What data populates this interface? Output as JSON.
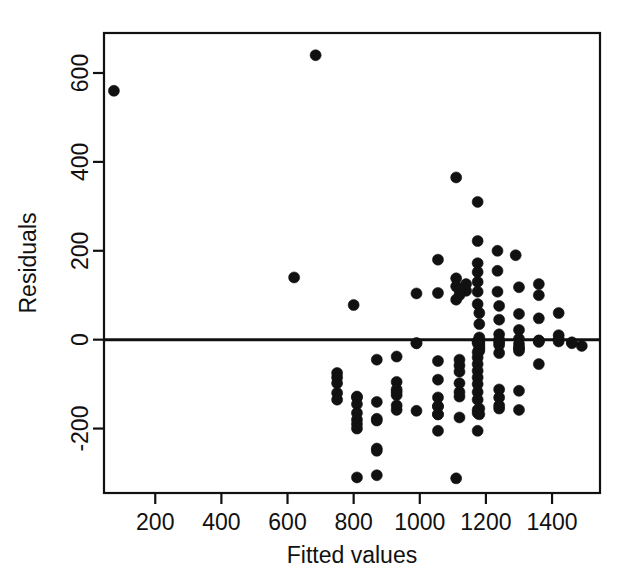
{
  "figure": {
    "kind": "residual-plot",
    "background_color": "#ffffff",
    "ink_color": "#111111"
  },
  "chart_data": {
    "type": "scatter",
    "title": "",
    "subtitle": "",
    "xlabel": "Fitted values",
    "ylabel": "Residuals",
    "xlim": [
      45,
      1545
    ],
    "ylim": [
      -345,
      690
    ],
    "xticks": [
      200,
      400,
      600,
      800,
      1000,
      1200,
      1400
    ],
    "xticklabels": [
      "200",
      "400",
      "600",
      "800",
      "1000",
      "1200",
      "1400"
    ],
    "yticks": [
      -200,
      0,
      200,
      400,
      600
    ],
    "yticklabels": [
      "-200",
      "0",
      "200",
      "400",
      "600"
    ],
    "grid": false,
    "legend": null,
    "legend_position": "none",
    "marker": {
      "shape": "circle",
      "filled": true,
      "color": "#111111",
      "size_px": 11
    },
    "reference_line": {
      "kind": "horizontal",
      "y": 0,
      "color": "#111111",
      "width_px": 3,
      "label": "zero residual line"
    },
    "n_points": 131,
    "x": [
      75,
      685,
      620,
      1055,
      1110,
      1175,
      1235,
      1175,
      1290,
      1175,
      1175,
      1235,
      1175,
      1110,
      1110,
      1175,
      1140,
      1140,
      1300,
      1360,
      1235,
      1360,
      1110,
      1175,
      1240,
      1300,
      1420,
      1360,
      1240,
      1300,
      1420,
      800,
      990,
      1180,
      1180,
      1240,
      1300,
      1360,
      1420,
      1460,
      1490,
      1180,
      1180,
      1180,
      1180,
      1180,
      1180,
      1180,
      1120,
      1055,
      1120,
      1240,
      1300,
      1175,
      1240,
      1300,
      1360,
      1175,
      1175,
      1175,
      1175,
      1175,
      1175,
      1175,
      1120,
      1120,
      1120,
      1055,
      1055,
      1055,
      1055,
      930,
      930,
      930,
      870,
      870,
      870,
      810,
      810,
      810,
      810,
      810,
      810,
      750,
      750,
      750,
      750,
      930,
      870,
      870,
      810,
      930,
      990,
      1055,
      1055,
      1120,
      1120,
      1175,
      1175,
      1240,
      1240,
      1240,
      1300,
      1300,
      1360,
      1240,
      1175,
      1120,
      1055,
      990,
      930,
      870,
      810,
      750,
      1110,
      870,
      1240,
      1175,
      1300,
      1240,
      1175,
      1300,
      1360,
      1420,
      1460,
      1180,
      1180,
      1120,
      1055,
      990,
      930
    ],
    "y": [
      560,
      640,
      140,
      180,
      365,
      310,
      200,
      222,
      190,
      172,
      152,
      155,
      130,
      138,
      120,
      108,
      125,
      110,
      118,
      125,
      108,
      100,
      90,
      80,
      76,
      58,
      60,
      48,
      45,
      22,
      10,
      78,
      104,
      60,
      35,
      12,
      2,
      -2,
      -4,
      -8,
      -14,
      0,
      -5,
      -10,
      -15,
      -20,
      -25,
      5,
      100,
      105,
      112,
      0,
      -20,
      -4,
      -6,
      -10,
      -2,
      -40,
      -55,
      -70,
      -85,
      -100,
      -118,
      -135,
      -45,
      -58,
      -72,
      -48,
      -90,
      -130,
      -150,
      -38,
      -95,
      -125,
      -45,
      -178,
      -245,
      -130,
      -145,
      -165,
      -180,
      -190,
      -200,
      -75,
      -85,
      -98,
      -135,
      -158,
      -182,
      -250,
      -310,
      -118,
      -8,
      -150,
      -205,
      -98,
      -118,
      -158,
      -205,
      -112,
      -130,
      -155,
      -115,
      -158,
      -55,
      -148,
      -165,
      -175,
      -168,
      -160,
      -148,
      -140,
      -128,
      -120,
      -312,
      -305,
      -30,
      -28,
      -25,
      -12,
      -8,
      -18,
      -5,
      2,
      -6,
      -155,
      -168,
      -128,
      -168,
      -8,
      -112
    ]
  }
}
